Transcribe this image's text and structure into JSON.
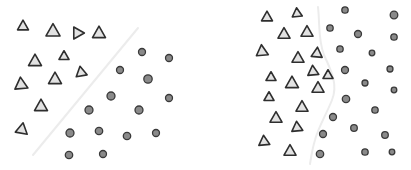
{
  "figure": {
    "colors": {
      "background": "#ffffff",
      "triangle_fill": "#e2e2e2",
      "triangle_stroke": "#2e2e2e",
      "circle_fill": "#8a8a8a",
      "circle_stroke": "#3a3a3a",
      "boundary": "#ececec"
    },
    "panels": [
      {
        "name": "linear-boundary",
        "boundary": {
          "type": "line",
          "points": [
            [
              33,
              155
            ],
            [
              138,
              28
            ]
          ]
        },
        "triangles": [
          {
            "x": 23,
            "y": 26,
            "s": 11,
            "rot": 0
          },
          {
            "x": 53,
            "y": 31,
            "s": 14,
            "rot": 0
          },
          {
            "x": 78,
            "y": 33,
            "s": 12,
            "rot": 90
          },
          {
            "x": 99,
            "y": 33,
            "s": 13,
            "rot": 0
          },
          {
            "x": 35,
            "y": 61,
            "s": 13,
            "rot": 0
          },
          {
            "x": 64,
            "y": 56,
            "s": 10,
            "rot": 0
          },
          {
            "x": 81,
            "y": 72,
            "s": 11,
            "rot": -10
          },
          {
            "x": 21,
            "y": 84,
            "s": 13,
            "rot": -5
          },
          {
            "x": 55,
            "y": 79,
            "s": 13,
            "rot": 0
          },
          {
            "x": 41,
            "y": 106,
            "s": 13,
            "rot": 0
          },
          {
            "x": 22,
            "y": 129,
            "s": 12,
            "rot": 10
          }
        ],
        "circles": [
          {
            "x": 142,
            "y": 52,
            "r": 3.5
          },
          {
            "x": 169,
            "y": 58,
            "r": 3.5
          },
          {
            "x": 120,
            "y": 70,
            "r": 3.5
          },
          {
            "x": 148,
            "y": 79,
            "r": 4.2
          },
          {
            "x": 169,
            "y": 98,
            "r": 3.5
          },
          {
            "x": 111,
            "y": 96,
            "r": 4
          },
          {
            "x": 89,
            "y": 110,
            "r": 4
          },
          {
            "x": 139,
            "y": 110,
            "r": 4
          },
          {
            "x": 70,
            "y": 133,
            "r": 4
          },
          {
            "x": 99,
            "y": 131,
            "r": 3.7
          },
          {
            "x": 127,
            "y": 136,
            "r": 3.7
          },
          {
            "x": 156,
            "y": 133,
            "r": 3.5
          },
          {
            "x": 69,
            "y": 155,
            "r": 3.7
          },
          {
            "x": 103,
            "y": 154,
            "r": 3.5
          }
        ]
      },
      {
        "name": "nonlinear-boundary",
        "boundary": {
          "type": "curve",
          "path": "M318,7 C320,25 318,40 324,55 C332,72 338,85 332,100 C326,115 318,128 315,140 C312,150 311,158 310,164"
        },
        "triangles": [
          {
            "x": 267,
            "y": 17,
            "s": 11,
            "rot": 0
          },
          {
            "x": 297,
            "y": 13,
            "s": 10,
            "rot": -5
          },
          {
            "x": 284,
            "y": 34,
            "s": 12,
            "rot": 0
          },
          {
            "x": 307,
            "y": 32,
            "s": 12,
            "rot": 0
          },
          {
            "x": 262,
            "y": 51,
            "s": 12,
            "rot": -5
          },
          {
            "x": 298,
            "y": 58,
            "s": 12,
            "rot": 0
          },
          {
            "x": 317,
            "y": 53,
            "s": 11,
            "rot": 5
          },
          {
            "x": 271,
            "y": 77,
            "s": 10,
            "rot": 0
          },
          {
            "x": 313,
            "y": 71,
            "s": 11,
            "rot": -5
          },
          {
            "x": 328,
            "y": 75,
            "s": 10,
            "rot": 0
          },
          {
            "x": 292,
            "y": 83,
            "s": 13,
            "rot": 0
          },
          {
            "x": 318,
            "y": 88,
            "s": 12,
            "rot": 0
          },
          {
            "x": 269,
            "y": 97,
            "s": 10,
            "rot": 0
          },
          {
            "x": 302,
            "y": 107,
            "s": 12,
            "rot": 0
          },
          {
            "x": 276,
            "y": 118,
            "s": 12,
            "rot": 0
          },
          {
            "x": 297,
            "y": 127,
            "s": 11,
            "rot": -5
          },
          {
            "x": 264,
            "y": 141,
            "s": 11,
            "rot": -5
          },
          {
            "x": 290,
            "y": 151,
            "s": 12,
            "rot": 0
          }
        ],
        "circles": [
          {
            "x": 345,
            "y": 10,
            "r": 3.2
          },
          {
            "x": 394,
            "y": 15,
            "r": 3.8
          },
          {
            "x": 330,
            "y": 28,
            "r": 3.2
          },
          {
            "x": 358,
            "y": 34,
            "r": 3.5
          },
          {
            "x": 394,
            "y": 37,
            "r": 3.2
          },
          {
            "x": 340,
            "y": 49,
            "r": 3.2
          },
          {
            "x": 372,
            "y": 53,
            "r": 2.8
          },
          {
            "x": 345,
            "y": 70,
            "r": 3.5
          },
          {
            "x": 390,
            "y": 69,
            "r": 3
          },
          {
            "x": 365,
            "y": 83,
            "r": 3
          },
          {
            "x": 394,
            "y": 90,
            "r": 2.8
          },
          {
            "x": 346,
            "y": 99,
            "r": 3.7
          },
          {
            "x": 375,
            "y": 110,
            "r": 3.2
          },
          {
            "x": 333,
            "y": 117,
            "r": 3.5
          },
          {
            "x": 354,
            "y": 128,
            "r": 3.3
          },
          {
            "x": 385,
            "y": 135,
            "r": 3.3
          },
          {
            "x": 323,
            "y": 134,
            "r": 3.5
          },
          {
            "x": 320,
            "y": 154,
            "r": 3.7
          },
          {
            "x": 365,
            "y": 152,
            "r": 3.2
          },
          {
            "x": 392,
            "y": 152,
            "r": 2.8
          }
        ]
      }
    ]
  }
}
